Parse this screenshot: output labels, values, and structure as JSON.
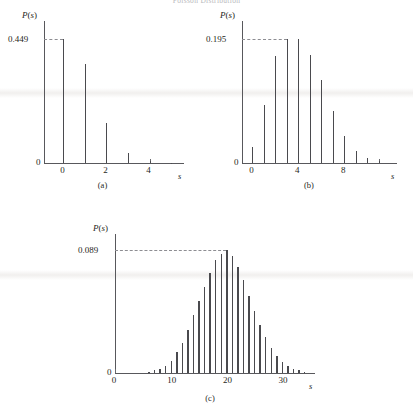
{
  "figure": {
    "running_head": "Poisson Distribution",
    "axis_label_y": "P(s)",
    "axis_label_x": "s",
    "zero_label": "0"
  },
  "panels": [
    {
      "caption": "(a)",
      "ymax_label": "0.449",
      "ylabel": "P(s)",
      "xlabel": "s",
      "zero": "0",
      "xticks": [
        {
          "value": 0,
          "label": "0"
        },
        {
          "value": 1,
          "label": ""
        },
        {
          "value": 2,
          "label": "2"
        },
        {
          "value": 3,
          "label": ""
        },
        {
          "value": 4,
          "label": "4"
        }
      ]
    },
    {
      "caption": "(b)",
      "ymax_label": "0.195",
      "ylabel": "P(s)",
      "xlabel": "s",
      "zero": "0",
      "xticks": [
        {
          "value": 0,
          "label": "0"
        },
        {
          "value": 1,
          "label": ""
        },
        {
          "value": 2,
          "label": ""
        },
        {
          "value": 3,
          "label": ""
        },
        {
          "value": 4,
          "label": "4"
        },
        {
          "value": 5,
          "label": ""
        },
        {
          "value": 6,
          "label": ""
        },
        {
          "value": 7,
          "label": ""
        },
        {
          "value": 8,
          "label": "8"
        },
        {
          "value": 9,
          "label": ""
        },
        {
          "value": 10,
          "label": ""
        },
        {
          "value": 11,
          "label": ""
        }
      ]
    },
    {
      "caption": "(c)",
      "ymax_label": "0.089",
      "ylabel": "P(s)",
      "xlabel": "s",
      "zero": "0",
      "xticks": [
        {
          "value": 0,
          "label": "0"
        },
        {
          "value": 10,
          "label": "10"
        },
        {
          "value": 20,
          "label": "20"
        },
        {
          "value": 30,
          "label": "30"
        }
      ]
    }
  ],
  "chart_data": [
    {
      "type": "bar",
      "title": "(a)",
      "xlabel": "s",
      "ylabel": "P(s)",
      "categories": [
        0,
        1,
        2,
        3,
        4,
        5
      ],
      "values": [
        0.449,
        0.359,
        0.144,
        0.038,
        0.008,
        0.001
      ],
      "ylim": [
        0,
        0.449
      ],
      "xlim": [
        -0.9,
        5.6
      ],
      "ymax_label": "0.449",
      "grid": false,
      "legend": "none",
      "note": "Poisson distribution, mean ~0.8"
    },
    {
      "type": "bar",
      "title": "(b)",
      "xlabel": "s",
      "ylabel": "P(s)",
      "categories": [
        0,
        1,
        2,
        3,
        4,
        5,
        6,
        7,
        8,
        9,
        10,
        11
      ],
      "values": [
        0.025,
        0.091,
        0.168,
        0.195,
        0.195,
        0.17,
        0.131,
        0.081,
        0.042,
        0.019,
        0.008,
        0.003
      ],
      "ylim": [
        0,
        0.195
      ],
      "xlim": [
        -0.9,
        12.6
      ],
      "ymax_label": "0.195",
      "grid": false,
      "legend": "none",
      "note": "Poisson distribution, mean ~3.7"
    },
    {
      "type": "bar",
      "title": "(c)",
      "xlabel": "s",
      "ylabel": "P(s)",
      "categories": [
        0,
        1,
        2,
        3,
        4,
        5,
        6,
        7,
        8,
        9,
        10,
        11,
        12,
        13,
        14,
        15,
        16,
        17,
        18,
        19,
        20,
        21,
        22,
        23,
        24,
        25,
        26,
        27,
        28,
        29,
        30,
        31,
        32,
        33,
        34
      ],
      "values": [
        0.0,
        0.0,
        0.0,
        0.0,
        0.0,
        0.0,
        0.001,
        0.002,
        0.003,
        0.005,
        0.009,
        0.015,
        0.022,
        0.031,
        0.042,
        0.052,
        0.062,
        0.072,
        0.082,
        0.086,
        0.089,
        0.085,
        0.077,
        0.067,
        0.056,
        0.045,
        0.035,
        0.026,
        0.018,
        0.012,
        0.008,
        0.005,
        0.003,
        0.002,
        0.001
      ],
      "ylim": [
        0,
        0.089
      ],
      "xlim": [
        0,
        36
      ],
      "ymax_label": "0.089",
      "grid": false,
      "legend": "none",
      "note": "Poisson distribution, mean ~20"
    }
  ]
}
